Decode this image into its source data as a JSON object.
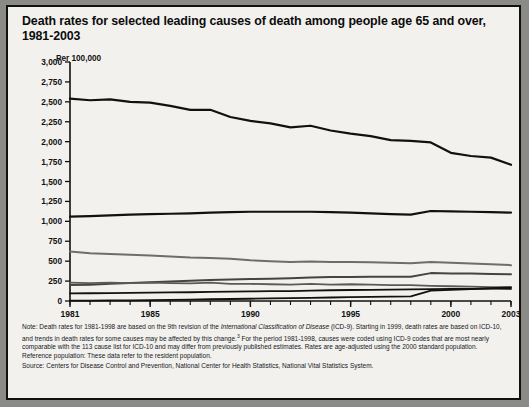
{
  "title": "Death rates for selected leading causes of death among people age 65 and over, 1981-2003",
  "axis_unit_label": "Per 100,000",
  "icd_marker": {
    "label": "ICD 10",
    "year": 1999
  },
  "notes": {
    "note_part1": "Note: Death rates for 1981-1998 are based on the 9th revision of the ",
    "note_italic": "International Classification of Disease",
    "note_part2": " (ICD-9). Starting in 1999, death rates are based on ICD-10, and trends in death rates for some causes may be affected by this change.",
    "note_sup": "3",
    "note_part3": " For the period 1981-1998, causes were coded using ICD-9 codes that are most nearly comparable with the 113 cause list for ICD-10 and may differ from previously published estimates. Rates are age-adjusted using the 2000 standard population.",
    "reference_population": "Reference population: These data refer to the resident population.",
    "source": "Source: Centers for Disease Control and Prevention,  National Center for Health Statistics, National Vital Statistics System."
  },
  "chart_data": {
    "type": "line",
    "title": "Death rates for selected leading causes of death among people age 65 and over, 1981-2003",
    "xlabel": "",
    "ylabel": "Per 100,000",
    "xlim": [
      1981,
      2003
    ],
    "ylim": [
      0,
      3000
    ],
    "ytick_labels": [
      "0",
      "250",
      "500",
      "750",
      "1,000",
      "1,250",
      "1,500",
      "1,750",
      "2,000",
      "2,250",
      "2,500",
      "2,750",
      "3,000"
    ],
    "ytick_values": [
      0,
      250,
      500,
      750,
      1000,
      1250,
      1500,
      1750,
      2000,
      2250,
      2500,
      2750,
      3000
    ],
    "xtick_labels": [
      "1981",
      "1985",
      "1990",
      "1995",
      "2000",
      "2003"
    ],
    "xtick_values": [
      1981,
      1985,
      1990,
      1995,
      2000,
      2003
    ],
    "grid": false,
    "legend": "inline-annotations",
    "x": [
      1981,
      1982,
      1983,
      1984,
      1985,
      1986,
      1987,
      1988,
      1989,
      1990,
      1991,
      1992,
      1993,
      1994,
      1995,
      1996,
      1997,
      1998,
      1999,
      2000,
      2001,
      2002,
      2003
    ],
    "series": [
      {
        "name": "Diseases of heart",
        "label": "Diseases of heart",
        "color": "#111111",
        "width": 2.2,
        "label_x": 1993.6,
        "label_y": 1960,
        "values": [
          2540,
          2520,
          2530,
          2500,
          2490,
          2450,
          2400,
          2400,
          2310,
          2260,
          2230,
          2180,
          2200,
          2140,
          2100,
          2070,
          2020,
          2010,
          1990,
          1860,
          1820,
          1800,
          1710
        ]
      },
      {
        "name": "Malignant neoplasms",
        "label": "Malignant neoplasms",
        "color": "#111111",
        "width": 2.2,
        "label_x": 1989.4,
        "label_y": 1215,
        "values": [
          1060,
          1065,
          1075,
          1085,
          1090,
          1095,
          1100,
          1110,
          1115,
          1120,
          1120,
          1120,
          1120,
          1115,
          1110,
          1100,
          1090,
          1085,
          1130,
          1125,
          1120,
          1115,
          1110
        ]
      },
      {
        "name": "Cerebrovascular diseases",
        "label": "Cerebrovascular diseases",
        "color": "#6d6d6d",
        "width": 2.0,
        "label_x": 1984.9,
        "label_y": 690,
        "values": [
          620,
          600,
          590,
          580,
          570,
          560,
          545,
          540,
          530,
          510,
          500,
          490,
          495,
          490,
          490,
          485,
          480,
          475,
          490,
          480,
          470,
          460,
          450
        ]
      },
      {
        "name": "Chronic lower respiratory diseases",
        "label": "Chronic lower respiratory diseases",
        "color": "#444444",
        "width": 2.0,
        "label_x": 1992.6,
        "label_y": 345,
        "values": [
          200,
          205,
          215,
          225,
          235,
          245,
          255,
          265,
          270,
          275,
          280,
          285,
          295,
          300,
          300,
          305,
          305,
          305,
          350,
          345,
          345,
          340,
          335
        ]
      },
      {
        "name": "Influenza and pneumonia",
        "label": "Influenza and pneumonia",
        "color": "#5a5a5a",
        "width": 1.8,
        "label_x": 1982.6,
        "label_y": 300,
        "values": [
          230,
          225,
          230,
          225,
          230,
          225,
          220,
          230,
          215,
          215,
          210,
          205,
          215,
          205,
          210,
          205,
          200,
          200,
          190,
          185,
          180,
          175,
          175
        ]
      },
      {
        "name": "Diabetes mellitus",
        "label": "Diabetes mellitus",
        "color": "#111111",
        "width": 1.8,
        "label_x": 1987.1,
        "label_y": 185,
        "values": [
          95,
          97,
          100,
          102,
          105,
          108,
          110,
          115,
          118,
          120,
          125,
          125,
          130,
          135,
          138,
          140,
          143,
          145,
          150,
          152,
          153,
          155,
          152
        ]
      },
      {
        "name": "Alzheimer's disease",
        "label": "Alzheimer's disease",
        "color": "#111111",
        "width": 1.8,
        "label_x": 1994.2,
        "label_y": 170,
        "values": [
          4,
          5,
          7,
          9,
          12,
          15,
          18,
          22,
          25,
          28,
          32,
          35,
          40,
          44,
          48,
          52,
          55,
          58,
          130,
          140,
          150,
          160,
          170
        ]
      }
    ]
  }
}
